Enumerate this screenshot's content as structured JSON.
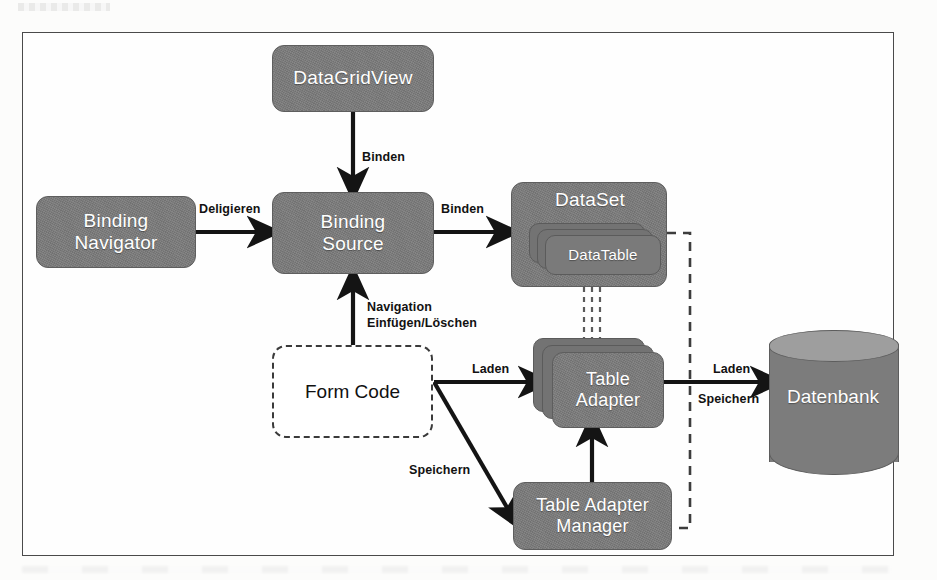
{
  "diagram": {
    "frame": {
      "border_color": "#4a4a4a",
      "background": "#fefefe"
    },
    "palette": {
      "node_fill": "#7b7b7b",
      "node_border": "#5e5e5e",
      "node_text": "#ffffff",
      "arrow": "#141414",
      "dashed": "#3d3d3d",
      "dashed_node_text": "#111111",
      "page_background": "#ffffff"
    },
    "nodes": [
      {
        "id": "datagridview",
        "label": "DataGridView",
        "style": "solid",
        "shape": "rounded-rect"
      },
      {
        "id": "binding-navigator",
        "label": "Binding\nNavigator",
        "style": "solid",
        "shape": "rounded-rect"
      },
      {
        "id": "binding-source",
        "label": "Binding\nSource",
        "style": "solid",
        "shape": "rounded-rect"
      },
      {
        "id": "dataset",
        "label": "DataSet",
        "style": "solid",
        "shape": "rounded-rect"
      },
      {
        "id": "datatable",
        "label": "DataTable",
        "style": "solid",
        "shape": "stacked-rect"
      },
      {
        "id": "form-code",
        "label": "Form Code",
        "style": "dashed",
        "shape": "rounded-rect"
      },
      {
        "id": "table-adapter",
        "label": "Table\nAdapter",
        "style": "solid",
        "shape": "stacked-rect"
      },
      {
        "id": "table-adapter-manager",
        "label": "Table Adapter\nManager",
        "style": "solid",
        "shape": "rounded-rect"
      },
      {
        "id": "datenbank",
        "label": "Datenbank",
        "style": "solid",
        "shape": "cylinder"
      }
    ],
    "node_labels": {
      "datagridview": "DataGridView",
      "binding_navigator_line1": "Binding",
      "binding_navigator_line2": "Navigator",
      "binding_source_line1": "Binding",
      "binding_source_line2": "Source",
      "dataset": "DataSet",
      "datatable": "DataTable",
      "form_code": "Form Code",
      "table_adapter_line1": "Table",
      "table_adapter_line2": "Adapter",
      "table_adapter_manager_line1": "Table Adapter",
      "table_adapter_manager_line2": "Manager",
      "datenbank": "Datenbank"
    },
    "edges": [
      {
        "id": "dgv-to-bs",
        "from": "datagridview",
        "to": "binding-source",
        "label": "Binden",
        "style": "solid",
        "direction": "down"
      },
      {
        "id": "bn-to-bs",
        "from": "binding-navigator",
        "to": "binding-source",
        "label": "Deligieren",
        "style": "solid",
        "direction": "right"
      },
      {
        "id": "bs-to-ds",
        "from": "binding-source",
        "to": "dataset",
        "label": "Binden",
        "style": "solid",
        "direction": "right"
      },
      {
        "id": "fc-to-bs",
        "from": "form-code",
        "to": "binding-source",
        "label": "Navigation\nEinfügen/Löschen",
        "style": "solid",
        "direction": "up"
      },
      {
        "id": "fc-to-ta",
        "from": "form-code",
        "to": "table-adapter",
        "label": "Laden",
        "style": "solid",
        "direction": "right"
      },
      {
        "id": "fc-to-tam",
        "from": "form-code",
        "to": "table-adapter-manager",
        "label": "Speichern",
        "style": "solid",
        "direction": "down-right"
      },
      {
        "id": "tam-to-ta",
        "from": "table-adapter-manager",
        "to": "table-adapter",
        "label": "",
        "style": "solid",
        "direction": "up"
      },
      {
        "id": "ta-to-db",
        "from": "table-adapter",
        "to": "datenbank",
        "label": "Laden",
        "label2": "Speichern",
        "style": "solid",
        "direction": "right"
      },
      {
        "id": "ds-to-ta",
        "from": "dataset",
        "to": "table-adapter",
        "label": "",
        "style": "dashed",
        "direction": "down"
      },
      {
        "id": "ds-to-tam",
        "from": "dataset",
        "to": "table-adapter-manager",
        "label": "",
        "style": "dashed",
        "direction": "around-right"
      }
    ],
    "edge_labels": {
      "binden_dgv": "Binden",
      "deligieren": "Deligieren",
      "binden_ds": "Binden",
      "navigation_line1": "Navigation",
      "navigation_line2": "Einfügen/Löschen",
      "laden_ta": "Laden",
      "speichern_tam": "Speichern",
      "laden_db": "Laden",
      "speichern_db": "Speichern"
    }
  }
}
